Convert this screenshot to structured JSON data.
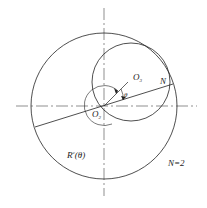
{
  "diagram": {
    "labels": {
      "o3": "O",
      "o3_sub": "3",
      "o2": "O",
      "o2_sub": "2",
      "n_point": "N",
      "theta": "θ",
      "radius_fn": "R",
      "radius_fn_sup": "c",
      "radius_fn_arg": "(θ)",
      "n_value": "N=2"
    },
    "colors": {
      "stroke": "#222222",
      "background": "#ffffff"
    },
    "geometry": {
      "outer_circle": {
        "cx": 104,
        "cy": 106,
        "r": 73
      },
      "inner_circle": {
        "cx": 131,
        "cy": 82,
        "r": 39
      },
      "chord": {
        "x1": 35,
        "y1": 127,
        "x2": 173,
        "y2": 84
      }
    }
  }
}
